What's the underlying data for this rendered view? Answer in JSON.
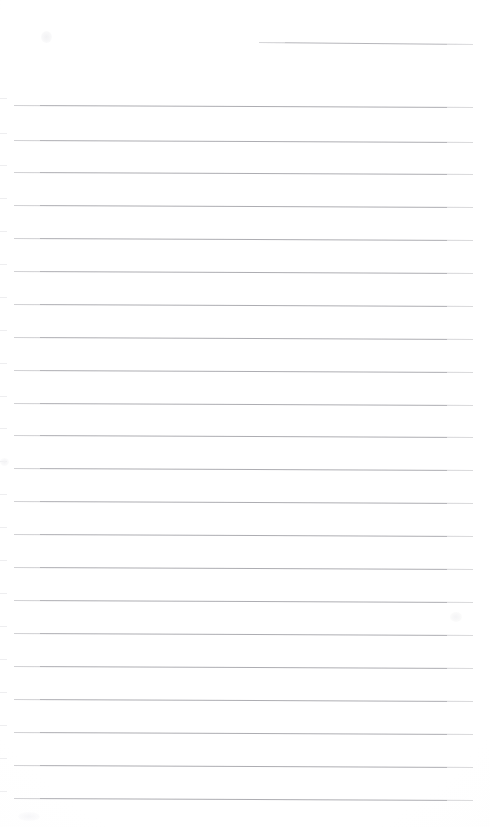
{
  "document": {
    "kind": "scanned-ruled-notebook-page",
    "title": "",
    "body_text": "",
    "page_width": 490,
    "page_height": 827,
    "background_color": "#ffffff",
    "rule_color": "#a9a9ae",
    "rule_thickness_px": 1,
    "line_spacing_px": 32.5,
    "left_margin_px": 14,
    "right_margin_px": 473,
    "total_rules": 23,
    "written_content": "none"
  },
  "header_rule": {
    "label": "header-rule",
    "x_start": 259,
    "x_end": 473,
    "y": 42,
    "slant_px": 2,
    "color": "#b2b2b7"
  },
  "rules": [
    {
      "index": 1,
      "y": 105,
      "x_start": 14,
      "x_end": 473,
      "slant_px": 2
    },
    {
      "index": 2,
      "y": 140,
      "x_start": 14,
      "x_end": 473,
      "slant_px": 2
    },
    {
      "index": 3,
      "y": 172,
      "x_start": 14,
      "x_end": 473,
      "slant_px": 2
    },
    {
      "index": 4,
      "y": 205,
      "x_start": 14,
      "x_end": 473,
      "slant_px": 2
    },
    {
      "index": 5,
      "y": 238,
      "x_start": 14,
      "x_end": 473,
      "slant_px": 2
    },
    {
      "index": 6,
      "y": 271,
      "x_start": 14,
      "x_end": 473,
      "slant_px": 2
    },
    {
      "index": 7,
      "y": 304,
      "x_start": 14,
      "x_end": 473,
      "slant_px": 2
    },
    {
      "index": 8,
      "y": 337,
      "x_start": 14,
      "x_end": 473,
      "slant_px": 2
    },
    {
      "index": 9,
      "y": 370,
      "x_start": 14,
      "x_end": 473,
      "slant_px": 2
    },
    {
      "index": 10,
      "y": 403,
      "x_start": 14,
      "x_end": 473,
      "slant_px": 2
    },
    {
      "index": 11,
      "y": 435,
      "x_start": 14,
      "x_end": 473,
      "slant_px": 2
    },
    {
      "index": 12,
      "y": 468,
      "x_start": 14,
      "x_end": 473,
      "slant_px": 2
    },
    {
      "index": 13,
      "y": 501,
      "x_start": 14,
      "x_end": 473,
      "slant_px": 2
    },
    {
      "index": 14,
      "y": 534,
      "x_start": 14,
      "x_end": 473,
      "slant_px": 2
    },
    {
      "index": 15,
      "y": 567,
      "x_start": 14,
      "x_end": 473,
      "slant_px": 2
    },
    {
      "index": 16,
      "y": 600,
      "x_start": 14,
      "x_end": 473,
      "slant_px": 2
    },
    {
      "index": 17,
      "y": 633,
      "x_start": 14,
      "x_end": 473,
      "slant_px": 2
    },
    {
      "index": 18,
      "y": 666,
      "x_start": 14,
      "x_end": 473,
      "slant_px": 2
    },
    {
      "index": 19,
      "y": 699,
      "x_start": 14,
      "x_end": 473,
      "slant_px": 2
    },
    {
      "index": 20,
      "y": 732,
      "x_start": 14,
      "x_end": 473,
      "slant_px": 2
    },
    {
      "index": 21,
      "y": 765,
      "x_start": 14,
      "x_end": 473,
      "slant_px": 2
    },
    {
      "index": 22,
      "y": 798,
      "x_start": 14,
      "x_end": 473,
      "slant_px": 2
    }
  ],
  "marks": [
    {
      "name": "smudge-top-left",
      "x": 41,
      "y": 31,
      "w": 11,
      "h": 12
    },
    {
      "name": "smudge-right-mid",
      "x": 450,
      "y": 612,
      "w": 12,
      "h": 10
    },
    {
      "name": "smudge-left-edge",
      "x": 0,
      "y": 458,
      "w": 9,
      "h": 8
    },
    {
      "name": "smudge-bottom-left",
      "x": 18,
      "y": 812,
      "w": 22,
      "h": 9
    }
  ]
}
